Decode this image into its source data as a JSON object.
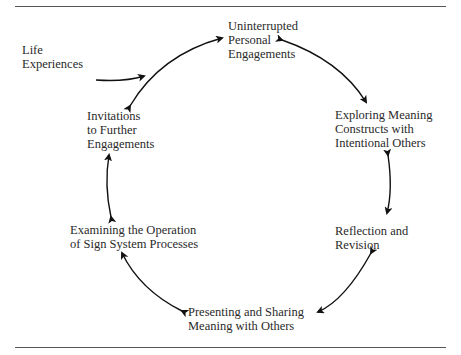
{
  "diagram": {
    "type": "cycle",
    "input": {
      "id": "life",
      "label": "Life\nExperiences"
    },
    "nodes": [
      {
        "id": "uninterrupted",
        "label": "Uninterrupted\nPersonal\nEngagements"
      },
      {
        "id": "exploring",
        "label": "Exploring Meaning\nConstructs with\nIntentional Others"
      },
      {
        "id": "reflection",
        "label": "Reflection and\nRevision"
      },
      {
        "id": "presenting",
        "label": "Presenting and Sharing\nMeaning with Others"
      },
      {
        "id": "examining",
        "label": "Examining the Operation\nof Sign System Processes"
      },
      {
        "id": "invitations",
        "label": "Invitations\nto Further\nEngagements"
      }
    ],
    "edges": [
      {
        "from": "life",
        "to": "cycle",
        "directed": true
      },
      {
        "from": "invitations",
        "to": "uninterrupted",
        "bidirectional": true
      },
      {
        "from": "uninterrupted",
        "to": "exploring",
        "bidirectional": true
      },
      {
        "from": "exploring",
        "to": "reflection",
        "bidirectional": true
      },
      {
        "from": "reflection",
        "to": "presenting",
        "bidirectional": true
      },
      {
        "from": "presenting",
        "to": "examining",
        "bidirectional": true
      },
      {
        "from": "examining",
        "to": "invitations",
        "bidirectional": true
      }
    ]
  }
}
